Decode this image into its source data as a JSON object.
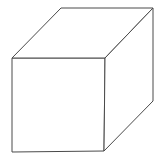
{
  "diagram": {
    "type": "wireframe-cube",
    "background": "#ffffff",
    "stroke_color": "#4a4a4a",
    "stroke_width": 1,
    "front_face": {
      "label": "front face",
      "points": [
        [
          12,
          58
        ],
        [
          105,
          58
        ],
        [
          104,
          151
        ],
        [
          12,
          152
        ]
      ]
    },
    "top_face": {
      "label": "top face",
      "points": [
        [
          12,
          58
        ],
        [
          61,
          8
        ],
        [
          153,
          8
        ],
        [
          105,
          58
        ]
      ]
    },
    "right_face": {
      "label": "right face",
      "points": [
        [
          105,
          58
        ],
        [
          153,
          8
        ],
        [
          153,
          101
        ],
        [
          104,
          151
        ]
      ]
    }
  }
}
